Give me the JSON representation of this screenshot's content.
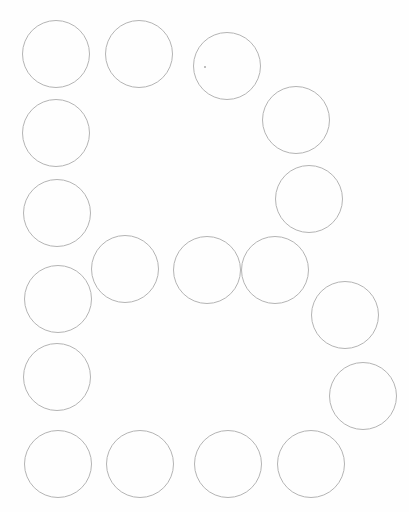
{
  "worksheet": {
    "description": "Dot-marker worksheet forming the letter B from circles",
    "letter": "B",
    "stroke_color": "#b4b4b4",
    "background_color": "#fefefe",
    "circle_count": 21,
    "circles": [
      {
        "cx": 56,
        "cy": 54,
        "r": 34
      },
      {
        "cx": 139,
        "cy": 54,
        "r": 34
      },
      {
        "cx": 227,
        "cy": 66,
        "r": 34
      },
      {
        "cx": 296,
        "cy": 120,
        "r": 34
      },
      {
        "cx": 56,
        "cy": 133,
        "r": 34
      },
      {
        "cx": 309,
        "cy": 199,
        "r": 34
      },
      {
        "cx": 57,
        "cy": 213,
        "r": 34
      },
      {
        "cx": 125,
        "cy": 269,
        "r": 34
      },
      {
        "cx": 207,
        "cy": 270,
        "r": 34
      },
      {
        "cx": 275,
        "cy": 270,
        "r": 34
      },
      {
        "cx": 345,
        "cy": 315,
        "r": 34
      },
      {
        "cx": 58,
        "cy": 299,
        "r": 34
      },
      {
        "cx": 57,
        "cy": 377,
        "r": 34
      },
      {
        "cx": 363,
        "cy": 396,
        "r": 34
      },
      {
        "cx": 58,
        "cy": 464,
        "r": 34
      },
      {
        "cx": 140,
        "cy": 464,
        "r": 34
      },
      {
        "cx": 228,
        "cy": 464,
        "r": 34
      },
      {
        "cx": 311,
        "cy": 464,
        "r": 34
      }
    ],
    "marks": [
      {
        "x": 205,
        "y": 67
      }
    ]
  }
}
